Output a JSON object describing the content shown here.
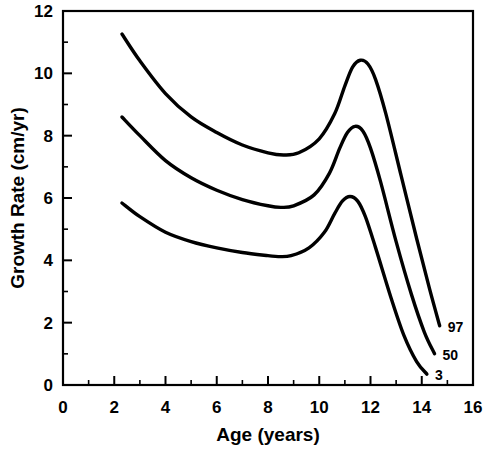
{
  "chart_data": {
    "type": "line",
    "title": "",
    "xlabel": "Age (years)",
    "ylabel": "Growth Rate (cm/yr)",
    "xlim": [
      0,
      16
    ],
    "ylim": [
      0,
      12
    ],
    "xticks": [
      0,
      2,
      4,
      6,
      8,
      10,
      12,
      14,
      16
    ],
    "yticks": [
      0,
      2,
      4,
      6,
      8,
      10,
      12
    ],
    "xminorticks": [
      1,
      3,
      5,
      7,
      9,
      11,
      13,
      15
    ],
    "yminorticks": [
      1,
      3,
      5,
      7,
      9,
      11
    ],
    "grid": false,
    "legend_position": "inline-right-end-labels",
    "line_color": "#000000",
    "line_width": 3.4,
    "series": [
      {
        "name": "97",
        "label": "97",
        "x": [
          2.3,
          3.0,
          4.0,
          5.0,
          6.0,
          7.0,
          8.0,
          8.6,
          9.2,
          10.0,
          10.6,
          11.0,
          11.3,
          11.6,
          11.9,
          12.2,
          12.6,
          13.2,
          13.8,
          14.3,
          14.7
        ],
        "y": [
          11.26,
          10.4,
          9.35,
          8.6,
          8.1,
          7.7,
          7.45,
          7.38,
          7.45,
          7.9,
          8.7,
          9.6,
          10.2,
          10.42,
          10.3,
          9.8,
          8.7,
          6.7,
          4.7,
          3.1,
          1.9
        ]
      },
      {
        "name": "50",
        "label": "50",
        "x": [
          2.3,
          3.0,
          4.0,
          5.0,
          6.0,
          7.0,
          8.0,
          8.5,
          9.0,
          9.8,
          10.4,
          10.8,
          11.1,
          11.4,
          11.7,
          12.0,
          12.4,
          13.0,
          13.6,
          14.1,
          14.5
        ],
        "y": [
          8.6,
          8.0,
          7.2,
          6.65,
          6.25,
          5.95,
          5.75,
          5.7,
          5.75,
          6.1,
          6.8,
          7.6,
          8.1,
          8.3,
          8.15,
          7.6,
          6.5,
          4.6,
          2.9,
          1.7,
          1.0
        ]
      },
      {
        "name": "3",
        "label": "3",
        "x": [
          2.3,
          3.0,
          4.0,
          5.0,
          6.0,
          7.0,
          8.0,
          8.4,
          8.9,
          9.6,
          10.2,
          10.6,
          10.9,
          11.2,
          11.5,
          11.8,
          12.2,
          12.8,
          13.3,
          13.8,
          14.2
        ],
        "y": [
          5.84,
          5.4,
          4.9,
          4.6,
          4.4,
          4.25,
          4.15,
          4.12,
          4.15,
          4.4,
          4.9,
          5.5,
          5.9,
          6.05,
          5.9,
          5.4,
          4.4,
          2.8,
          1.6,
          0.75,
          0.35
        ]
      }
    ]
  },
  "axes": {
    "x_title": "Age (years)",
    "y_title": "Growth Rate (cm/yr)",
    "x_tick_labels": [
      "0",
      "2",
      "4",
      "6",
      "8",
      "10",
      "12",
      "14",
      "16"
    ],
    "y_tick_labels": [
      "0",
      "2",
      "4",
      "6",
      "8",
      "10",
      "12"
    ]
  },
  "series_labels": [
    "97",
    "50",
    "3"
  ]
}
